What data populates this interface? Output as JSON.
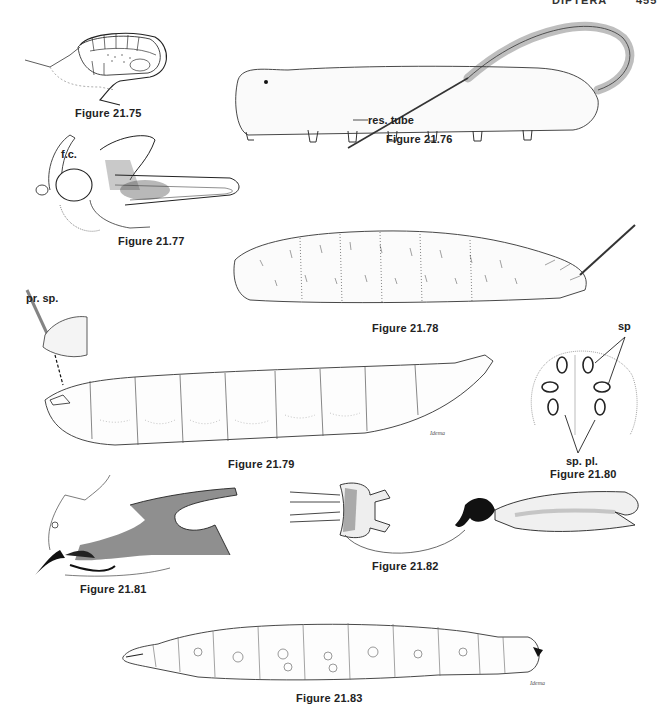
{
  "page_header": {
    "running_title": "DIPTERA",
    "page_number": "455"
  },
  "figures": [
    {
      "id": "21.75",
      "caption": "Figure 21.75",
      "labels": []
    },
    {
      "id": "21.76",
      "caption": "Figure 21.76",
      "labels": [
        "res. tube"
      ]
    },
    {
      "id": "21.77",
      "caption": "Figure 21.77",
      "labels": [
        "f.c."
      ]
    },
    {
      "id": "21.78",
      "caption": "Figure 21.78",
      "labels": []
    },
    {
      "id": "21.79",
      "caption": "Figure 21.79",
      "labels": [
        "pr. sp."
      ],
      "signature": "Idema"
    },
    {
      "id": "21.80",
      "caption": "Figure 21.80",
      "labels": [
        "sp",
        "sp. pl."
      ]
    },
    {
      "id": "21.81",
      "caption": "Figure 21.81",
      "labels": []
    },
    {
      "id": "21.82",
      "caption": "Figure 21.82",
      "labels": []
    },
    {
      "id": "21.83",
      "caption": "Figure 21.83",
      "labels": [],
      "signature": "Idema"
    }
  ],
  "colors": {
    "ink": "#1a1a1a",
    "paper": "#ffffff",
    "shade": "#555555"
  }
}
